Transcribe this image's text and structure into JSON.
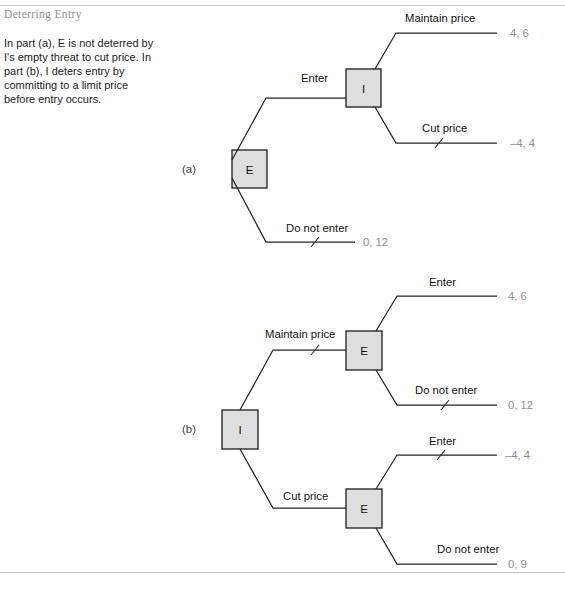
{
  "figure": {
    "title": "Deterring Entry",
    "caption": "In part (a), E is not deterred by I's empty threat to cut price. In part (b), I deters entry by committing to a limit price before entry occurs.",
    "accent_color": "#8e8f91",
    "node_fill": "#dedede",
    "line_color": "#242424",
    "payoff_color": "#8d8e90"
  },
  "parts": [
    {
      "label": "(a)",
      "root": {
        "player": "E",
        "name": "entrant-node"
      },
      "nodes": [
        {
          "id": "a-root",
          "player": "E",
          "x": 249,
          "y": 169
        },
        {
          "id": "a-inc",
          "player": "I",
          "x": 364,
          "y": 88
        }
      ],
      "branches": [
        {
          "id": "a-enter",
          "label": "Enter",
          "from": "a-root",
          "to": "a-inc",
          "crossed": false,
          "payoff": ""
        },
        {
          "id": "a-maintain",
          "label": "Maintain price",
          "from": "a-inc",
          "to": "terminal",
          "crossed": false,
          "payoff": "4, 6"
        },
        {
          "id": "a-cut",
          "label": "Cut price",
          "from": "a-inc",
          "to": "terminal",
          "crossed": true,
          "payoff": "–4, 4"
        },
        {
          "id": "a-notenter",
          "label": "Do not enter",
          "from": "a-root",
          "to": "terminal",
          "crossed": true,
          "payoff": "0, 12"
        }
      ]
    },
    {
      "label": "(b)",
      "root": {
        "player": "I",
        "name": "incumbent-node"
      },
      "nodes": [
        {
          "id": "b-root",
          "player": "I",
          "x": 240,
          "y": 429
        },
        {
          "id": "b-e-top",
          "player": "E",
          "x": 364,
          "y": 351
        },
        {
          "id": "b-e-bot",
          "player": "E",
          "x": 364,
          "y": 510
        }
      ],
      "branches": [
        {
          "id": "b-maintain",
          "label": "Maintain price",
          "from": "b-root",
          "to": "b-e-top",
          "crossed": true,
          "payoff": ""
        },
        {
          "id": "b-top-enter",
          "label": "Enter",
          "from": "b-e-top",
          "to": "terminal",
          "crossed": false,
          "payoff": "4, 6"
        },
        {
          "id": "b-top-notenter",
          "label": "Do not enter",
          "from": "b-e-top",
          "to": "terminal",
          "crossed": true,
          "payoff": "0, 12"
        },
        {
          "id": "b-cut",
          "label": "Cut price",
          "from": "b-root",
          "to": "b-e-bot",
          "crossed": false,
          "payoff": ""
        },
        {
          "id": "b-bot-enter",
          "label": "Enter",
          "from": "b-e-bot",
          "to": "terminal",
          "crossed": true,
          "payoff": "–4, 4"
        },
        {
          "id": "b-bot-notenter",
          "label": "Do not enter",
          "from": "b-e-bot",
          "to": "terminal",
          "crossed": false,
          "payoff": "0, 9"
        }
      ]
    }
  ],
  "text": {
    "part_a_label": "(a)",
    "part_b_label": "(b)",
    "node_e": "E",
    "node_i": "I",
    "enter": "Enter",
    "do_not_enter": "Do not enter",
    "maintain_price": "Maintain price",
    "cut_price": "Cut price",
    "payoff_a_maintain": "4, 6",
    "payoff_a_cut": "–4, 4",
    "payoff_a_notenter": "0, 12",
    "payoff_b_top_enter": "4, 6",
    "payoff_b_top_notenter": "0, 12",
    "payoff_b_bot_enter": "–4, 4",
    "payoff_b_bot_notenter": "0, 9"
  }
}
